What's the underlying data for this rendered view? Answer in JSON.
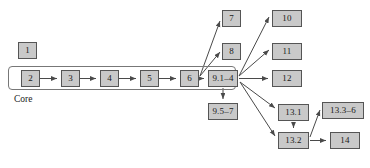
{
  "diagram": {
    "type": "flowchart",
    "style": {
      "node_fill": "#c9c9c9",
      "node_border": "#555555",
      "edge_color": "#4a4a4a",
      "group_border": "#777777",
      "background": "#ffffff",
      "text_color": "#1a1a1a"
    },
    "groups": [
      {
        "id": "core",
        "label": "Core",
        "x": 8,
        "y": 66,
        "w": 228,
        "h": 24,
        "label_x": 14,
        "label_y": 94
      }
    ],
    "nodes": [
      {
        "id": "n1",
        "label": "1",
        "x": 18,
        "y": 42,
        "w": 19,
        "h": 17
      },
      {
        "id": "n2",
        "label": "2",
        "x": 21,
        "y": 70,
        "w": 19,
        "h": 17
      },
      {
        "id": "n3",
        "label": "3",
        "x": 61,
        "y": 70,
        "w": 19,
        "h": 17
      },
      {
        "id": "n4",
        "label": "4",
        "x": 100,
        "y": 70,
        "w": 19,
        "h": 17
      },
      {
        "id": "n5",
        "label": "5",
        "x": 140,
        "y": 70,
        "w": 19,
        "h": 17
      },
      {
        "id": "n6",
        "label": "6",
        "x": 180,
        "y": 70,
        "w": 19,
        "h": 17
      },
      {
        "id": "n7",
        "label": "7",
        "x": 222,
        "y": 10,
        "w": 19,
        "h": 17
      },
      {
        "id": "n8",
        "label": "8",
        "x": 222,
        "y": 43,
        "w": 19,
        "h": 17
      },
      {
        "id": "n914",
        "label": "9.1–4",
        "x": 208,
        "y": 70,
        "w": 30,
        "h": 17
      },
      {
        "id": "n957",
        "label": "9.5–7",
        "x": 208,
        "y": 103,
        "w": 30,
        "h": 17
      },
      {
        "id": "n10",
        "label": "10",
        "x": 272,
        "y": 10,
        "w": 30,
        "h": 17
      },
      {
        "id": "n11",
        "label": "11",
        "x": 272,
        "y": 43,
        "w": 30,
        "h": 17
      },
      {
        "id": "n12",
        "label": "12",
        "x": 272,
        "y": 70,
        "w": 30,
        "h": 17
      },
      {
        "id": "n131",
        "label": "13.1",
        "x": 278,
        "y": 104,
        "w": 31,
        "h": 17
      },
      {
        "id": "n132",
        "label": "13.2",
        "x": 278,
        "y": 132,
        "w": 31,
        "h": 17
      },
      {
        "id": "n1336",
        "label": "13.3–6",
        "x": 322,
        "y": 102,
        "w": 42,
        "h": 17
      },
      {
        "id": "n14",
        "label": "14",
        "x": 330,
        "y": 132,
        "w": 30,
        "h": 17
      }
    ],
    "edges": [
      {
        "from": "n2",
        "to": "n3",
        "path": "M40,78.5 L57,78.5"
      },
      {
        "from": "n3",
        "to": "n4",
        "path": "M80,78.5 L96,78.5"
      },
      {
        "from": "n4",
        "to": "n5",
        "path": "M119,78.5 L136,78.5"
      },
      {
        "from": "n5",
        "to": "n6",
        "path": "M159,78.5 L176,78.5"
      },
      {
        "from": "n6",
        "to": "n914",
        "path": "M199,78.5 L204,78.5"
      },
      {
        "from": "n6",
        "to": "n7",
        "path": "M200,76 L220,21"
      },
      {
        "from": "n6",
        "to": "n8",
        "path": "M200,76 L220,52"
      },
      {
        "from": "n914",
        "to": "n10",
        "path": "M239,76 L269,17"
      },
      {
        "from": "n914",
        "to": "n11",
        "path": "M239,76 L269,50"
      },
      {
        "from": "n914",
        "to": "n12",
        "path": "M239,78.5 L268,78.5"
      },
      {
        "from": "n914",
        "to": "n957",
        "path": "M223,88 L223,99"
      },
      {
        "from": "n914",
        "to": "n131",
        "path": "M240,82 L275,108"
      },
      {
        "from": "n914",
        "to": "n132",
        "path": "M240,82 L275,136"
      },
      {
        "from": "n131",
        "to": "n132",
        "path": "M293.5,122 L293.5,128"
      },
      {
        "from": "n132",
        "to": "n1336",
        "path": "M310,137 L320,110"
      },
      {
        "from": "n132",
        "to": "n14",
        "path": "M310,140.5 L326,140.5"
      }
    ]
  }
}
